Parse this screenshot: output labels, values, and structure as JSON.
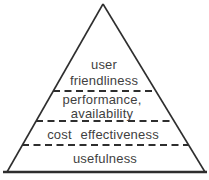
{
  "diagram": {
    "type": "pyramid",
    "colors": {
      "line": "#2e2e2e",
      "text": "#3f3f3f",
      "background": "#ffffff"
    },
    "layers": [
      {
        "lines": [
          "user",
          "friendliness"
        ]
      },
      {
        "lines": [
          "performance,",
          "availability"
        ]
      },
      {
        "lines": [
          "cost effectiveness"
        ]
      },
      {
        "lines": [
          "usefulness"
        ]
      }
    ]
  }
}
